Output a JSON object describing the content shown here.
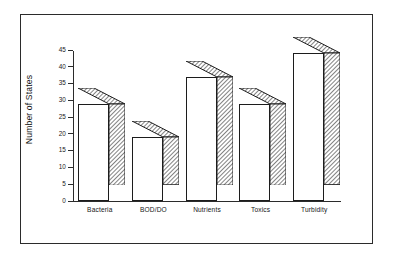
{
  "figure": {
    "background_color": "#ffffff",
    "frame_color": "#2b2b2b",
    "bar_face_color": "#ffffff",
    "bar_edge_color": "#1c1c1c",
    "bar_hatch": "diagonal-lines"
  },
  "chart_data": {
    "type": "bar",
    "title": "",
    "subtitle": "",
    "xlabel": "",
    "ylabel": "Number of States",
    "categories": [
      "Bacteria",
      "BOD/DO",
      "Nutrients",
      "Toxics",
      "Turbidity"
    ],
    "values": [
      29,
      19,
      37,
      29,
      44
    ],
    "ylim": [
      0,
      45
    ],
    "yticks": [
      0,
      5,
      10,
      15,
      20,
      25,
      30,
      35,
      40,
      45
    ],
    "ytick_labels": [
      "0",
      "5",
      "10",
      "15",
      "20",
      "25",
      "30",
      "35",
      "40",
      "45"
    ],
    "grid": false,
    "legend": null,
    "style": "3d-shadow-bars",
    "annotations": []
  }
}
